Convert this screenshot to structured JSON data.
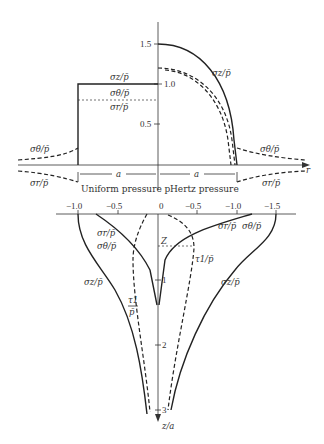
{
  "top_plot": {
    "y_ticks": [
      "1.5",
      "1.0",
      "0.5"
    ],
    "left_region_label": "Uniform pressure p",
    "right_region_label": "Hertz pressure",
    "dimension_left": "a",
    "dimension_right": "a",
    "r_axis_label": "r",
    "curve_labels": {
      "uniform_sigma_z": "σz/p̄",
      "uniform_sigma_theta": "σθ/p̄",
      "uniform_sigma_r": "σr/p̄",
      "hertz_sigma_z": "σz/p̄",
      "outer_left_sigma_theta": "σθ/p̄",
      "outer_left_sigma_r": "σr/p̄",
      "outer_right_sigma_theta": "σθ/p̄",
      "outer_right_sigma_r": "σr/p̄"
    }
  },
  "bottom_plot": {
    "x_ticks": [
      "−1.0",
      "−0.5",
      "0",
      "−0.5",
      "−1.0",
      "−1.5"
    ],
    "z_ticks": [
      "1",
      "2",
      "3"
    ],
    "z_axis_label": "z/a",
    "marker_label": "Z",
    "curve_labels": {
      "left_sigma_r": "σr/p̄",
      "left_sigma_theta": "σθ/p̄",
      "left_sigma_z": "σz/p̄",
      "left_tau1_num": "τ1",
      "left_tau1_den": "p̄",
      "right_sigma_r": "σr/p̄",
      "right_sigma_theta": "σθ/p̄",
      "right_tau1": "τ1/p̄",
      "right_sigma_z": "σz/p̄"
    }
  }
}
